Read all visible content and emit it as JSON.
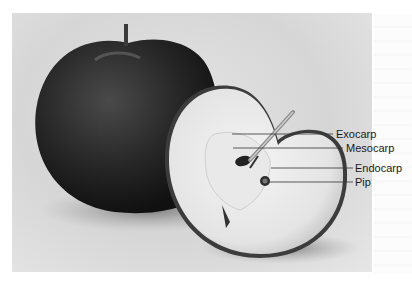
{
  "figure": {
    "labels": [
      {
        "text": "Exocarp",
        "x": 336,
        "y": 128,
        "line": {
          "x1": 232,
          "x2": 333,
          "y": 134
        }
      },
      {
        "text": "Mesocarp",
        "x": 346,
        "y": 142,
        "line": {
          "x1": 233,
          "x2": 343,
          "y": 148
        }
      },
      {
        "text": "Endocarp",
        "x": 355,
        "y": 162,
        "line": {
          "x1": 271,
          "x2": 353,
          "y": 168
        }
      },
      {
        "text": "Pip",
        "x": 355,
        "y": 176,
        "line": {
          "x1": 268,
          "x2": 353,
          "y": 182
        }
      }
    ],
    "colors": {
      "background": "#d9d9d9",
      "whole_apple": "#2a2a2a",
      "flesh": "#ececec",
      "leader_line": "#333333"
    }
  }
}
